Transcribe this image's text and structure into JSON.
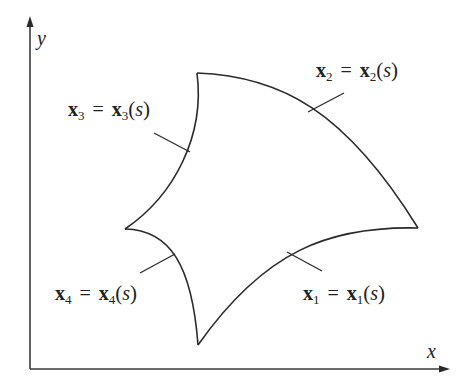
{
  "diagram": {
    "axes": {
      "x_label": "x",
      "y_label": "y"
    },
    "curves": [
      {
        "id": "x1",
        "bold": "x",
        "sub": "1",
        "eq": "=",
        "rhs_bold": "x",
        "rhs_sub": "1",
        "arg_open": "(",
        "arg": "s",
        "arg_close": ")"
      },
      {
        "id": "x2",
        "bold": "x",
        "sub": "2",
        "eq": "=",
        "rhs_bold": "x",
        "rhs_sub": "2",
        "arg_open": "(",
        "arg": "s",
        "arg_close": ")"
      },
      {
        "id": "x3",
        "bold": "x",
        "sub": "3",
        "eq": "=",
        "rhs_bold": "x",
        "rhs_sub": "3",
        "arg_open": "(",
        "arg": "s",
        "arg_close": ")"
      },
      {
        "id": "x4",
        "bold": "x",
        "sub": "4",
        "eq": "=",
        "rhs_bold": "x",
        "rhs_sub": "4",
        "arg_open": "(",
        "arg": "s",
        "arg_close": ")"
      }
    ],
    "colors": {
      "stroke": "#2a2a2a",
      "background": "#ffffff"
    }
  }
}
